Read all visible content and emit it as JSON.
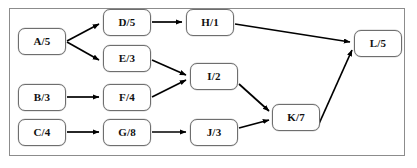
{
  "diagram": {
    "type": "directed-acyclic-graph",
    "frame": {
      "border_color": "#8c8c8c",
      "background": "#ffffff",
      "x": 9,
      "y": 8,
      "width": 396,
      "height": 148
    },
    "node_style": {
      "fill": "#ffffff",
      "stroke": "#6e6e6e",
      "text_color": "#111111",
      "corner_radius": 7
    },
    "edge_style": {
      "stroke": "#000000",
      "arrowhead": "filled-triangle"
    },
    "nodes": [
      {
        "id": "A",
        "label": "A/5",
        "x": 18,
        "y": 28,
        "w": 48,
        "h": 27
      },
      {
        "id": "B",
        "label": "B/3",
        "x": 18,
        "y": 84,
        "w": 48,
        "h": 27
      },
      {
        "id": "C",
        "label": "C/4",
        "x": 18,
        "y": 119,
        "w": 48,
        "h": 27
      },
      {
        "id": "D",
        "label": "D/5",
        "x": 103,
        "y": 9,
        "w": 48,
        "h": 27
      },
      {
        "id": "E",
        "label": "E/3",
        "x": 103,
        "y": 45,
        "w": 48,
        "h": 27
      },
      {
        "id": "F",
        "label": "F/4",
        "x": 103,
        "y": 84,
        "w": 48,
        "h": 27
      },
      {
        "id": "G",
        "label": "G/8",
        "x": 103,
        "y": 119,
        "w": 48,
        "h": 27
      },
      {
        "id": "H",
        "label": "H/1",
        "x": 186,
        "y": 9,
        "w": 48,
        "h": 27
      },
      {
        "id": "I",
        "label": "I/2",
        "x": 190,
        "y": 63,
        "w": 48,
        "h": 27
      },
      {
        "id": "J",
        "label": "J/3",
        "x": 190,
        "y": 119,
        "w": 48,
        "h": 27
      },
      {
        "id": "K",
        "label": "K/7",
        "x": 272,
        "y": 104,
        "w": 48,
        "h": 27
      },
      {
        "id": "L",
        "label": "L/5",
        "x": 354,
        "y": 30,
        "w": 48,
        "h": 27
      }
    ],
    "edges": [
      {
        "from": "A",
        "to": "D",
        "path": "M 67,41 L 99,24"
      },
      {
        "from": "A",
        "to": "E",
        "path": "M 67,42 L 99,60"
      },
      {
        "from": "D",
        "to": "H",
        "path": "M 152,22 L 182,22"
      },
      {
        "from": "H",
        "to": "L",
        "path": "M 235,24 L 350,42"
      },
      {
        "from": "E",
        "to": "I",
        "path": "M 152,60 L 186,75"
      },
      {
        "from": "B",
        "to": "F",
        "path": "M 67,97 L 99,97"
      },
      {
        "from": "F",
        "to": "I",
        "path": "M 152,97 L 186,80"
      },
      {
        "from": "I",
        "to": "K",
        "path": "M 239,84 L 269,111"
      },
      {
        "from": "C",
        "to": "G",
        "path": "M 67,132 L 99,132"
      },
      {
        "from": "G",
        "to": "J",
        "path": "M 152,132 L 186,132"
      },
      {
        "from": "J",
        "to": "K",
        "path": "M 239,128 L 269,120"
      },
      {
        "from": "K",
        "to": "L",
        "path": "M 318,126 L 352,50"
      }
    ]
  }
}
